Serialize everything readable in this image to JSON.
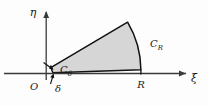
{
  "figure": {
    "kind": "complex-plane-contour-diagram",
    "axes": {
      "horizontal_label": "ξ",
      "vertical_label": "η",
      "origin_label": "O"
    },
    "labels": {
      "inner_radius": "δ",
      "outer_radius": "R",
      "inner_arc_base": "C",
      "inner_arc_sub": "δ",
      "outer_arc_base": "C",
      "outer_arc_sub": "R"
    },
    "colors": {
      "fill": "#d6d6d6",
      "outline": "#111111",
      "axis": "#3a3a3a",
      "text": "#1a1a1a",
      "background": "#fdfdfd"
    },
    "geometry": {
      "origin_x": 46,
      "axis_y": 73,
      "inner_radius_px": 7,
      "outer_radius_px": 95,
      "sector_start_angle_deg": 2,
      "sector_end_angle_deg": 31
    }
  }
}
